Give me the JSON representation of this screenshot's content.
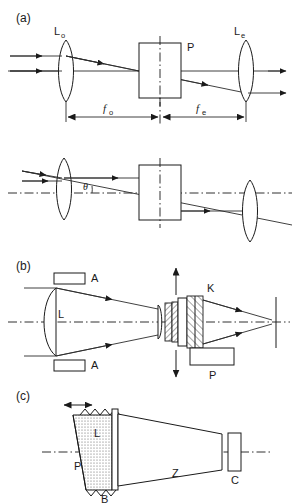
{
  "figure": {
    "background_color": "#ffffff",
    "line_color": "#1a1a1a",
    "panels": [
      {
        "id": "a",
        "label": "(a)",
        "description": "Telescope with objective lens, plate and eyepiece; upper sub-diagram on-axis, lower sub-diagram tilted by angle theta",
        "labels": {
          "objective": "L",
          "objective_sub": "o",
          "eyepiece": "L",
          "eyepiece_sub": "e",
          "plate": "P",
          "focal_objective": "f",
          "focal_objective_sub": "o",
          "focal_eyepiece": "f",
          "focal_eyepiece_sub": "e",
          "angle": "θ"
        }
      },
      {
        "id": "b",
        "label": "(b)",
        "description": "Converging beam from lens L through apertures A, crystal stack K, with mount P and vertical translation arrows",
        "labels": {
          "lens": "L",
          "aperture_top": "A",
          "aperture_bottom": "A",
          "crystal": "K",
          "mount": "P"
        }
      },
      {
        "id": "c",
        "label": "(c)",
        "description": "Tilted prism P with bellows B and window L, tapered tube Z and camera C; double arrow indicates translation",
        "labels": {
          "prism": "P",
          "window": "L",
          "bellows": "B",
          "tube": "Z",
          "camera": "C"
        }
      }
    ]
  }
}
